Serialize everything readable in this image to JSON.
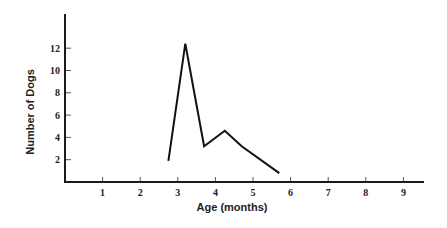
{
  "chart_data": {
    "type": "line",
    "title": "",
    "xlabel": "Age (months)",
    "ylabel": "Number of Dogs",
    "x_ticks": [
      1,
      2,
      3,
      4,
      5,
      6,
      7,
      8,
      9
    ],
    "y_ticks": [
      2,
      4,
      6,
      8,
      10,
      12
    ],
    "xlim": [
      0,
      9.55
    ],
    "ylim": [
      0,
      15
    ],
    "grid": false,
    "legend": null,
    "series": [
      {
        "name": "Number of Dogs",
        "x": [
          2.75,
          3.2,
          3.7,
          4.25,
          4.7,
          5.7
        ],
        "y": [
          1.9,
          12.4,
          3.2,
          4.6,
          3.2,
          0.8
        ]
      }
    ]
  },
  "colors": {
    "line": "#111111",
    "axis": "#1a1a1a",
    "background": "#ffffff"
  }
}
